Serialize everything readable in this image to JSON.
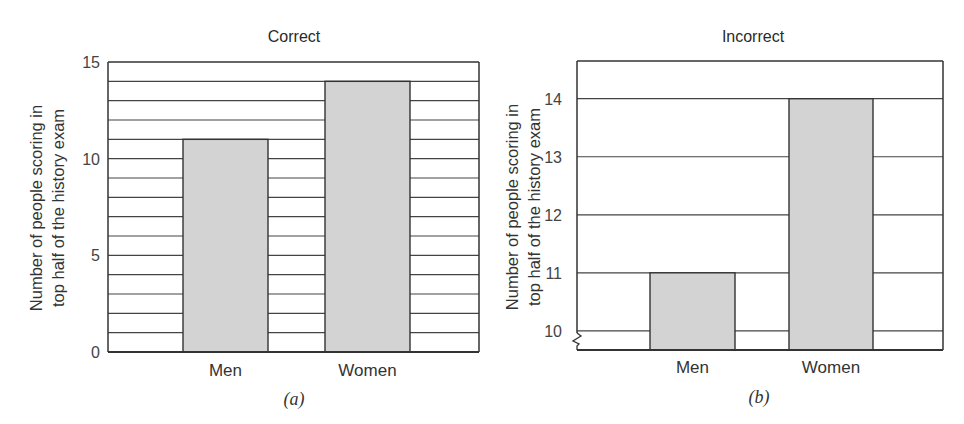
{
  "chart_data": [
    {
      "type": "bar",
      "title": "Correct",
      "caption": "(a)",
      "categories": [
        "Men",
        "Women"
      ],
      "values": [
        11,
        14
      ],
      "xlabel": "",
      "ylabel": "Number of people scoring in top half of the history exam",
      "ylabel_lines": [
        "Number of people scoring in",
        "top half of the history exam"
      ],
      "ylim": [
        0,
        15
      ],
      "yticks": [
        0,
        5,
        10,
        15
      ],
      "grid": true,
      "grid_step": 1,
      "bar_color": "#d3d3d3",
      "axis_break": false
    },
    {
      "type": "bar",
      "title": "Incorrect",
      "caption": "(b)",
      "categories": [
        "Men",
        "Women"
      ],
      "values": [
        11,
        14
      ],
      "xlabel": "",
      "ylabel": "Number of people scoring in top half of the history exam",
      "ylabel_lines": [
        "Number of people scoring in",
        "top half of the history exam"
      ],
      "ylim": [
        9.67,
        14.65
      ],
      "yticks": [
        10,
        11,
        12,
        13,
        14
      ],
      "grid": true,
      "grid_step": 1,
      "bar_color": "#d3d3d3",
      "axis_break": true
    }
  ]
}
